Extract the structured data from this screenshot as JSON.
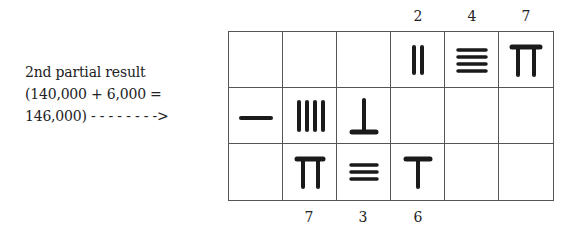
{
  "caption": {
    "line1": "2nd partial result",
    "line2": "(140,000 + 6,000 =",
    "line3": "146,000) - - - - - - - ->"
  },
  "top_labels": [
    {
      "col": 4,
      "text": "2"
    },
    {
      "col": 5,
      "text": "4"
    },
    {
      "col": 6,
      "text": "7"
    }
  ],
  "bottom_labels": [
    {
      "col": 2,
      "text": "7"
    },
    {
      "col": 3,
      "text": "3"
    },
    {
      "col": 4,
      "text": "6"
    }
  ],
  "grid": {
    "rows": 3,
    "cols": 6,
    "cells": [
      [
        "",
        "",
        "",
        "rod-2-vertical",
        "rod-4-horizontal",
        "rod-7-vertical"
      ],
      [
        "rod-1-horizontal",
        "rod-4-vertical",
        "rod-6-horizontal",
        "",
        "",
        ""
      ],
      [
        "",
        "rod-7-vertical",
        "rod-3-horizontal",
        "rod-6-vertical",
        "",
        ""
      ]
    ],
    "values": [
      [
        null,
        null,
        null,
        2,
        4,
        7
      ],
      [
        1,
        4,
        6,
        null,
        null,
        null
      ],
      [
        null,
        7,
        3,
        6,
        null,
        null
      ]
    ]
  },
  "colors": {
    "rod": "#1a1a1a",
    "grid_line": "#555555"
  }
}
